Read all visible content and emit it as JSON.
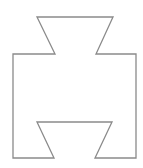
{
  "diagram": {
    "type": "outline-shape",
    "stroke_color": "#8a8a8a",
    "fill_color": "none",
    "background": "#ffffff",
    "points": "37,17 113,17 96,54 136,54 136,158 95,158 112,122 37,122 54,158 13,158 13,54 55,54"
  }
}
